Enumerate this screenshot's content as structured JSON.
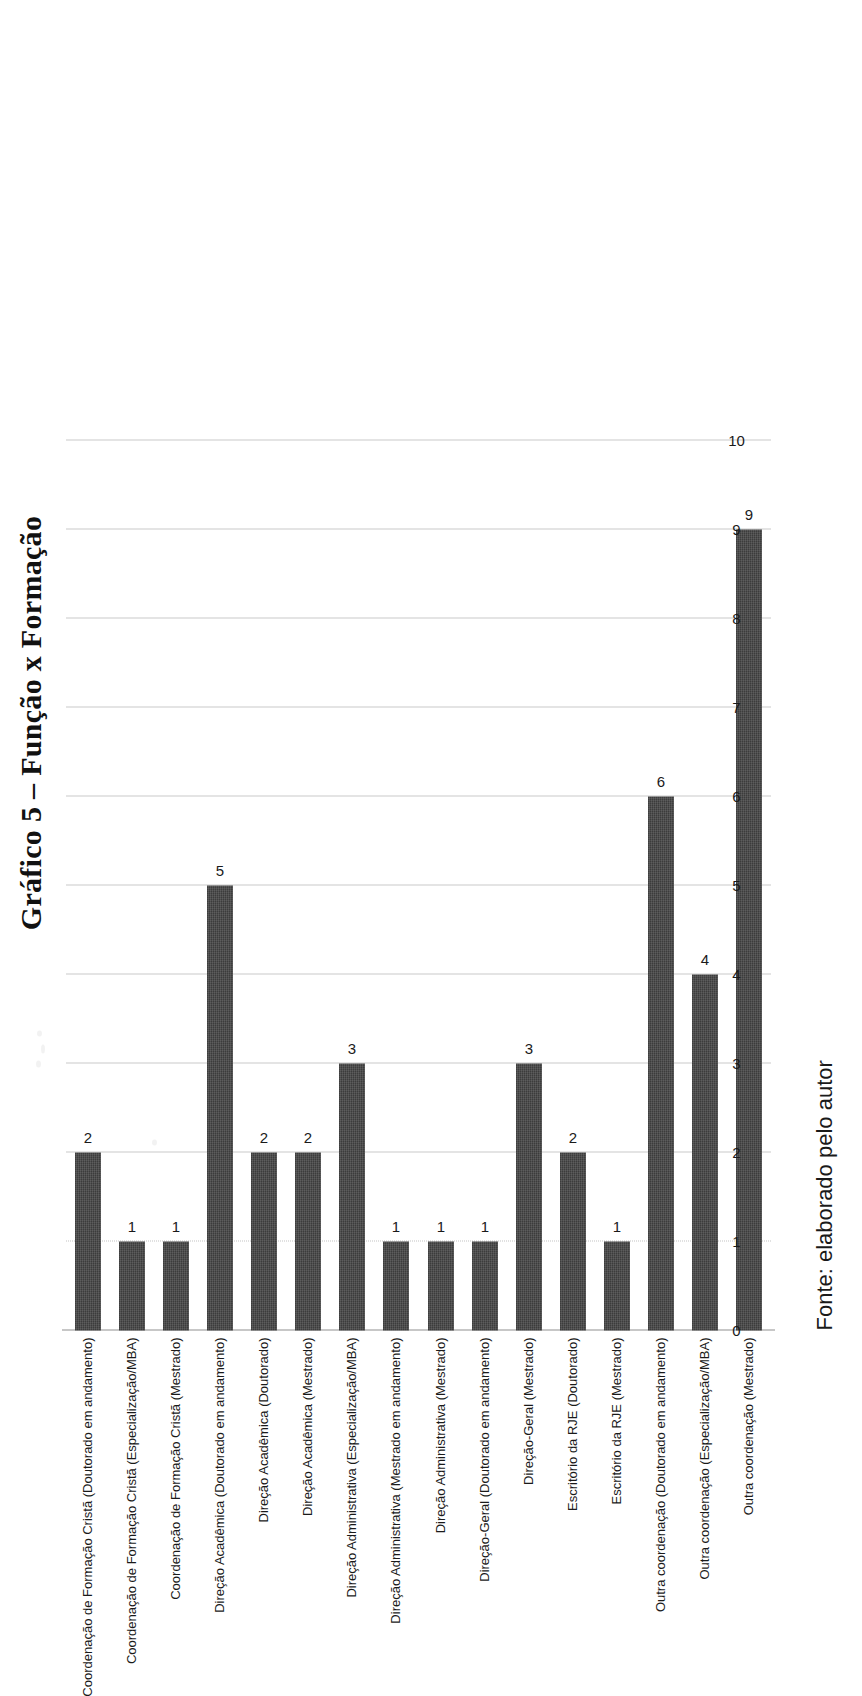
{
  "title": "Gráfico 5 – Função x Formação",
  "source_note": "Fonte: elaborado pelo autor",
  "chart_data": {
    "type": "bar",
    "orientation": "vertical",
    "title": "Gráfico 5 – Função x Formação",
    "xlabel": "",
    "ylabel": "",
    "ylim": [
      0,
      10
    ],
    "grid": true,
    "legend": "none",
    "axis_ticks": [
      "0",
      "1",
      "2",
      "3",
      "4",
      "5",
      "6",
      "7",
      "8",
      "9",
      "10"
    ],
    "bar_color": "#3c3c3c",
    "gridline_color": "#c9c9c9",
    "categories": [
      "Coordenação de Formação Cristã (Doutorado em andamento)",
      "Coordenação de Formação Cristã (Especialização/MBA)",
      "Coordenação de Formação Cristã (Mestrado)",
      "Direção Acadêmica (Doutorado em andamento)",
      "Direção Acadêmica (Doutorado)",
      "Direção Acadêmica (Mestrado)",
      "Direção Administrativa (Especialização/MBA)",
      "Direção Administrativa (Mestrado em andamento)",
      "Direção Administrativa (Mestrado)",
      "Direção-Geral (Doutorado em andamento)",
      "Direção-Geral (Mestrado)",
      "Escritório da RJE (Doutorado)",
      "Escritório da RJE (Mestrado)",
      "Outra coordenação (Doutorado em andamento)",
      "Outra coordenação (Especialização/MBA)",
      "Outra coordenação (Mestrado)"
    ],
    "values": [
      2,
      1,
      1,
      5,
      2,
      2,
      3,
      1,
      1,
      1,
      3,
      2,
      1,
      6,
      4,
      9
    ],
    "data_labels": [
      "2",
      "1",
      "1",
      "5",
      "2",
      "2",
      "3",
      "1",
      "1",
      "1",
      "3",
      "2",
      "1",
      "6",
      "4",
      "9"
    ]
  }
}
